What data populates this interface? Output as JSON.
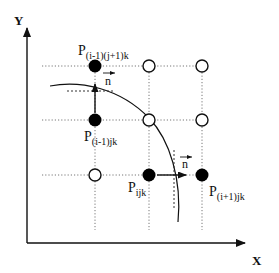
{
  "diagram": {
    "axes": {
      "x_label": "X",
      "y_label": "Y"
    },
    "points": {
      "top": {
        "base": "P",
        "sub": "(i-1)(j+1)k"
      },
      "mid": {
        "base": "P",
        "sub": "(i-1)jk"
      },
      "center": {
        "base": "P",
        "sub": "ijk"
      },
      "right": {
        "base": "P",
        "sub": "(i+1)jk"
      }
    },
    "normals": {
      "upper": "n",
      "lower": "n"
    },
    "colors": {
      "line": "#111111",
      "grid": "#777777",
      "filled_node": "#000000",
      "open_node": "#ffffff"
    }
  }
}
